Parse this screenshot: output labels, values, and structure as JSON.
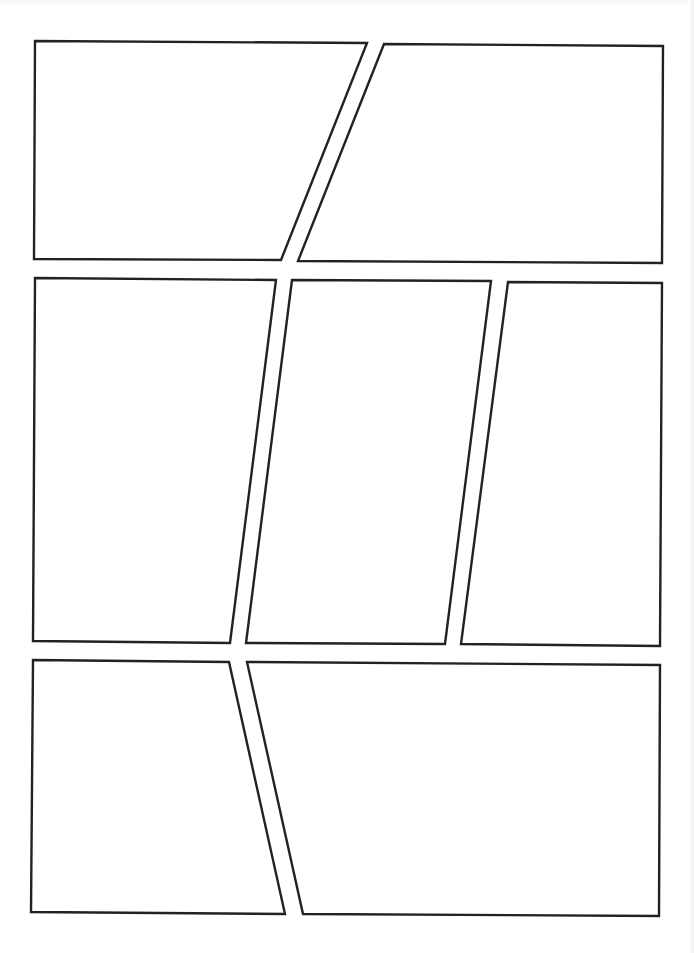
{
  "page": {
    "background_color": "#ffffff",
    "border_color": "#222222",
    "panel_count": 7,
    "rows": [
      {
        "row": 1,
        "panels": [
          "panel-1",
          "panel-2"
        ]
      },
      {
        "row": 2,
        "panels": [
          "panel-3",
          "panel-4",
          "panel-5"
        ]
      },
      {
        "row": 3,
        "panels": [
          "panel-6",
          "panel-7"
        ]
      }
    ],
    "panels": [
      {
        "id": "panel-1",
        "points": "35,41 367,43 281,260 34,259"
      },
      {
        "id": "panel-2",
        "points": "384,44 663,46 662,263 298,261"
      },
      {
        "id": "panel-3",
        "points": "35,278 276,280 230,643 33,641"
      },
      {
        "id": "panel-4",
        "points": "292,280 491,281 445,644 246,643"
      },
      {
        "id": "panel-5",
        "points": "508,282 662,283 660,646 461,644"
      },
      {
        "id": "panel-6",
        "points": "33,660 229,662 285,914 31,912"
      },
      {
        "id": "panel-7",
        "points": "247,662 660,665 659,916 303,914"
      }
    ]
  }
}
